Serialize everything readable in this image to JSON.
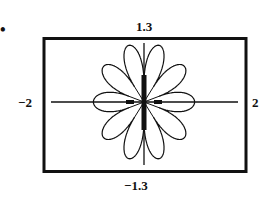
{
  "figure": {
    "marker": "•",
    "window": {
      "ymax_label": "1.3",
      "ymin_label": "−1.3",
      "xmin_label": "−2",
      "xmax_label": "2"
    }
  },
  "chart_data": {
    "type": "line",
    "title": "",
    "xlim": [
      -2,
      2
    ],
    "ylim": [
      -1.3,
      1.3
    ],
    "xlabel": "",
    "ylabel": "",
    "tick_labels": {
      "x": [
        "−2",
        "2"
      ],
      "y": [
        "−1.3",
        "1.3"
      ]
    },
    "grid": false,
    "petals": 10,
    "approx_extent": {
      "x": [
        -0.95,
        0.95
      ],
      "y": [
        -1.2,
        1.2
      ]
    }
  }
}
